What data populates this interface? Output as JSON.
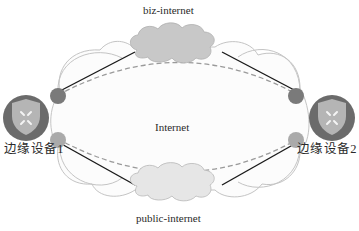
{
  "diagram": {
    "type": "network-topology",
    "center_network": {
      "label": "Internet"
    },
    "clouds": [
      {
        "id": "biz",
        "label": "biz-internet",
        "fill": "#c8c8c8",
        "position": "top"
      },
      {
        "id": "public",
        "label": "public-internet",
        "fill": "#e4e4e4",
        "position": "bottom"
      }
    ],
    "devices": [
      {
        "id": "edge1",
        "label": "边缘设备1",
        "position": "left"
      },
      {
        "id": "edge2",
        "label": "边缘设备2",
        "position": "right"
      }
    ],
    "links": [
      {
        "from": "edge1",
        "to": "biz",
        "style": "solid"
      },
      {
        "from": "biz",
        "to": "edge2",
        "style": "solid"
      },
      {
        "from": "edge1",
        "to": "public",
        "style": "solid"
      },
      {
        "from": "public",
        "to": "edge2",
        "style": "solid"
      },
      {
        "from": "edge1",
        "to": "edge2",
        "style": "dashed",
        "via": "biz"
      },
      {
        "from": "edge1",
        "to": "edge2",
        "style": "dashed",
        "via": "public"
      }
    ],
    "colors": {
      "device_ring": "#6b6b6b",
      "shield": "#b5b5b5",
      "port_dark": "#7a7a7a",
      "port_light": "#aaaaaa",
      "solid_link": "#1a1a1a",
      "dashed_link": "#9a9a9a",
      "internet_outline": "#c4c4c4"
    }
  }
}
